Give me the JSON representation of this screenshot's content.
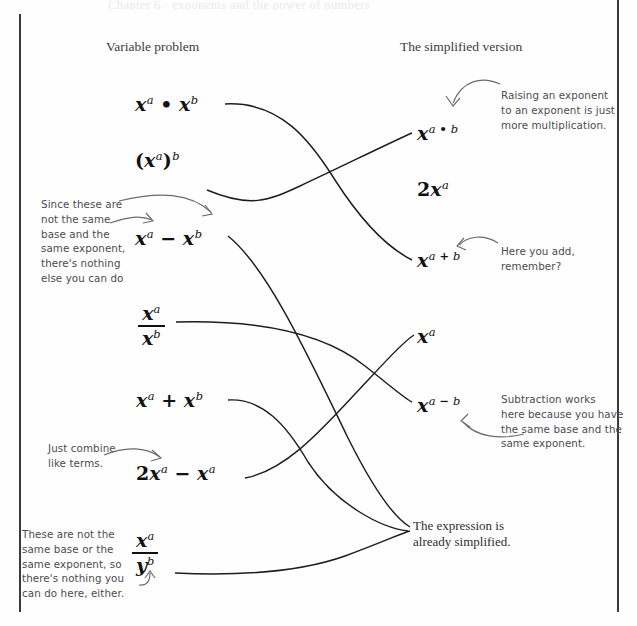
{
  "page": {
    "cut_off_top_line": "Chapter 6  ·  exponents and the power of numbers",
    "border_color": "#3a3a3a",
    "background_color": "#fefefe",
    "ink_color": "#1d1d1d",
    "handwriting_color": "#4a4a52"
  },
  "headings": {
    "left": "Variable problem",
    "right": "The simplified version"
  },
  "left_column": [
    {
      "id": "prob-1",
      "label": "x^a • x^b",
      "parts": {
        "base1": "x",
        "exp1": "a",
        "operator": "•",
        "base2": "x",
        "exp2": "b"
      }
    },
    {
      "id": "prob-2",
      "label": "(x^a)^b",
      "parts": {
        "base1": "x",
        "exp1": "a",
        "outer_exp": "b"
      }
    },
    {
      "id": "prob-3",
      "label": "x^a − x^b",
      "parts": {
        "base1": "x",
        "exp1": "a",
        "operator": "−",
        "base2": "x",
        "exp2": "b"
      }
    },
    {
      "id": "prob-4",
      "label": "x^a / x^b",
      "parts": {
        "numerator_base": "x",
        "numerator_exp": "a",
        "denominator_base": "x",
        "denominator_exp": "b"
      }
    },
    {
      "id": "prob-5",
      "label": "x^a + x^b",
      "parts": {
        "base1": "x",
        "exp1": "a",
        "operator": "+",
        "base2": "x",
        "exp2": "b"
      }
    },
    {
      "id": "prob-6",
      "label": "2x^a − x^a",
      "parts": {
        "coefficient": "2",
        "base1": "x",
        "exp1": "a",
        "operator": "−",
        "base2": "x",
        "exp2": "a"
      }
    },
    {
      "id": "prob-7",
      "label": "x^a / y^b",
      "parts": {
        "numerator_base": "x",
        "numerator_exp": "a",
        "denominator_base": "y",
        "denominator_exp": "b"
      }
    }
  ],
  "right_column": [
    {
      "id": "ans-1",
      "label": "x^(a • b)",
      "parts": {
        "base": "x",
        "exp_left": "a",
        "exp_op": "•",
        "exp_right": "b"
      }
    },
    {
      "id": "ans-2",
      "label": "2x^a",
      "parts": {
        "coefficient": "2",
        "base": "x",
        "exp": "a"
      }
    },
    {
      "id": "ans-3",
      "label": "x^(a + b)",
      "parts": {
        "base": "x",
        "exp_left": "a",
        "exp_op": "+",
        "exp_right": "b"
      }
    },
    {
      "id": "ans-4",
      "label": "x^a",
      "parts": {
        "base": "x",
        "exp": "a"
      }
    },
    {
      "id": "ans-5",
      "label": "x^(a − b)",
      "parts": {
        "base": "x",
        "exp_left": "a",
        "exp_op": "−",
        "exp_right": "b"
      }
    },
    {
      "id": "ans-6",
      "label": "The expression is already simplified.",
      "lines": [
        "The expression is",
        "already simplified."
      ]
    }
  ],
  "annotations": [
    {
      "id": "note-not-same-base",
      "side": "left",
      "target": "prob-3",
      "lines": [
        "Since these are",
        "not the same",
        "base and the",
        "same exponent,",
        "there's nothing",
        "else you can do"
      ]
    },
    {
      "id": "note-combine-like-terms",
      "side": "left",
      "target": "prob-6",
      "lines": [
        "Just combine",
        "like terms."
      ]
    },
    {
      "id": "note-not-same-base-or-exponent",
      "side": "left",
      "target": "prob-7",
      "lines": [
        "These are not the",
        "same base or the",
        "same exponent, so",
        "there's nothing you",
        "can do here, either."
      ]
    },
    {
      "id": "note-raising-exponent",
      "side": "right",
      "target": "ans-1",
      "lines": [
        "Raising an exponent",
        "to an exponent is just",
        "more multiplication."
      ]
    },
    {
      "id": "note-here-you-add",
      "side": "right",
      "target": "ans-3",
      "lines": [
        "Here you add,",
        "remember?"
      ]
    },
    {
      "id": "note-subtraction-works",
      "side": "right",
      "target": "ans-5",
      "lines": [
        "Subtraction works",
        "here because you have",
        "the same base and the",
        "same exponent."
      ]
    }
  ],
  "connections": [
    {
      "from": "prob-1",
      "to": "ans-3"
    },
    {
      "from": "prob-2",
      "to": "ans-1"
    },
    {
      "from": "prob-3",
      "to": "ans-6"
    },
    {
      "from": "prob-4",
      "to": "ans-5"
    },
    {
      "from": "prob-5",
      "to": "ans-6"
    },
    {
      "from": "prob-6",
      "to": "ans-4"
    },
    {
      "from": "prob-7",
      "to": "ans-6"
    }
  ]
}
